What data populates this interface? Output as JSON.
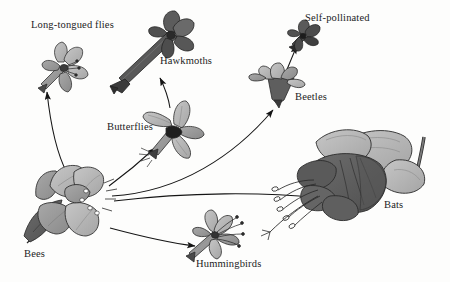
{
  "figure": {
    "background_color": "#fdfdfc",
    "palette": {
      "light_gray": "#b9b9b9",
      "mid_gray": "#9a9a9a",
      "dark_gray": "#666666",
      "darker_gray": "#4a4a4a",
      "outline": "#2b2b2b",
      "text": "#1c1c1c"
    }
  },
  "labels": {
    "long_tongued_flies": "Long-tongued flies",
    "hawkmoths": "Hawkmoths",
    "butterflies": "Butterflies",
    "self_pollinated": "Self-pollinated",
    "beetles": "Beetles",
    "bats": "Bats",
    "hummingbirds": "Hummingbirds",
    "bees": "Bees"
  },
  "nodes": [
    {
      "id": "bees",
      "label": "Bees",
      "role": "source",
      "x": 70,
      "y": 205,
      "description": "Large open wide-petalled bee flower with nectar guides"
    },
    {
      "id": "long_tongued_flies",
      "label": "Long-tongued flies",
      "role": "target",
      "x": 62,
      "y": 62,
      "description": "Small pale star-shaped flower with slender tube"
    },
    {
      "id": "hawkmoths",
      "label": "Hawkmoths",
      "role": "target",
      "x": 155,
      "y": 45,
      "description": "Dark flower with very long narrow corolla tube"
    },
    {
      "id": "butterflies",
      "label": "Butterflies",
      "role": "target",
      "x": 175,
      "y": 122,
      "description": "Mid-gray flower with flaring lobes and narrow tube"
    },
    {
      "id": "beetles",
      "label": "Beetles",
      "role": "target",
      "x": 281,
      "y": 82,
      "description": "Bowl-shaped flower with dark cup and spreading lobes"
    },
    {
      "id": "self_pollinated",
      "label": "Self-pollinated",
      "role": "target",
      "x": 300,
      "y": 32,
      "description": "Very small dark closed flower"
    },
    {
      "id": "bats",
      "label": "Bats",
      "role": "target",
      "x": 365,
      "y": 180,
      "description": "Very large robust flower with exserted stamens"
    },
    {
      "id": "hummingbirds",
      "label": "Hummingbirds",
      "role": "target",
      "x": 215,
      "y": 235,
      "description": "Tubular flower with reflexed lobes and protruding stamens"
    }
  ],
  "arrows": [
    {
      "from": "bees",
      "to": "long_tongued_flies"
    },
    {
      "from": "butterflies",
      "to": "hawkmoths"
    },
    {
      "from": "bees",
      "to": "butterflies"
    },
    {
      "from": "beetles",
      "to": "self_pollinated"
    },
    {
      "from": "bees",
      "to": "beetles"
    },
    {
      "from": "bees",
      "to": "bats"
    },
    {
      "from": "bees",
      "to": "hummingbirds"
    }
  ]
}
